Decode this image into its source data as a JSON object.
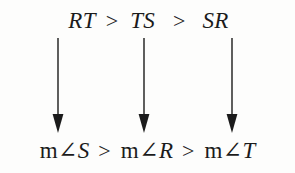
{
  "figure": {
    "type": "math-inequality-diagram",
    "ink_color": "#1b1b1b",
    "background_color": "#fdfdfc",
    "statement": "RT > TS > SR  implies  m∠S > m∠R > m∠T"
  },
  "top_row": {
    "terms": [
      {
        "label": "RT"
      },
      {
        "label": "TS"
      },
      {
        "label": "SR"
      }
    ],
    "operators": [
      {
        "label": ">"
      },
      {
        "label": ">"
      }
    ]
  },
  "bottom_row": {
    "terms": [
      {
        "lead": "m",
        "angle": "∠",
        "vertex": "S"
      },
      {
        "lead": "m",
        "angle": "∠",
        "vertex": "R"
      },
      {
        "lead": "m",
        "angle": "∠",
        "vertex": "T"
      }
    ],
    "operators": [
      {
        "label": ">"
      },
      {
        "label": ">"
      }
    ]
  },
  "arrows": [
    {
      "name": "arrow-rt-to-angle-s",
      "direction": "down"
    },
    {
      "name": "arrow-ts-to-angle-r",
      "direction": "down"
    },
    {
      "name": "arrow-sr-to-angle-t",
      "direction": "down"
    }
  ]
}
